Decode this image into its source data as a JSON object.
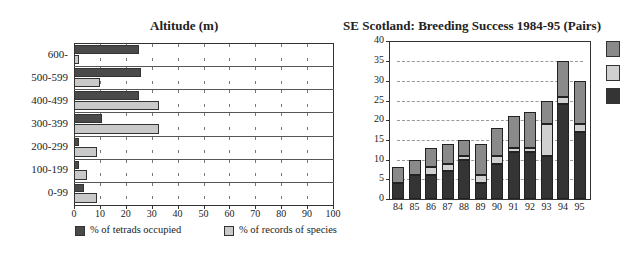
{
  "colors": {
    "left_tetrads": "#4a4a4a",
    "left_records": "#c9c9c9",
    "right_top": "#8a8a8a",
    "right_mid": "#d0d0d0",
    "right_bottom": "#343434"
  },
  "chart_data": [
    {
      "type": "bar",
      "orientation": "horizontal",
      "title": "Altitude (m)",
      "categories": [
        "600-",
        "500-599",
        "400-499",
        "300-399",
        "200-299",
        "100-199",
        "0-99"
      ],
      "series": [
        {
          "name": "% of tetrads occupied",
          "values": [
            25,
            26,
            25,
            11,
            2,
            2,
            4
          ]
        },
        {
          "name": "% of records of species",
          "values": [
            2,
            10,
            33,
            33,
            9,
            5,
            9
          ]
        }
      ],
      "xlabel": "",
      "ylabel": "",
      "xlim": [
        0,
        100
      ],
      "xticks": [
        "0",
        "10",
        "20",
        "30",
        "40",
        "50",
        "60",
        "70",
        "80",
        "90",
        "100"
      ],
      "grid": "dotted tick marks",
      "legend_position": "bottom"
    },
    {
      "type": "bar",
      "orientation": "vertical",
      "stacked": true,
      "title": "SE Scotland:  Breeding Success 1984-95 (Pairs)",
      "categories": [
        "84",
        "85",
        "86",
        "87",
        "88",
        "89",
        "90",
        "91",
        "92",
        "93",
        "94",
        "95"
      ],
      "series": [
        {
          "name": "bottom (dark)",
          "values": [
            4,
            6,
            6,
            7,
            10,
            4,
            9,
            12,
            12,
            11,
            24,
            17
          ]
        },
        {
          "name": "middle (light)",
          "values": [
            0,
            0,
            2,
            2,
            1,
            2,
            2,
            1,
            1,
            8,
            2,
            2
          ]
        },
        {
          "name": "top (mid gray)",
          "values": [
            4,
            4,
            5,
            5,
            4,
            8,
            7,
            8,
            9,
            6,
            9,
            11
          ]
        }
      ],
      "totals": [
        8,
        10,
        13,
        14,
        15,
        14,
        18,
        21,
        22,
        25,
        35,
        30
      ],
      "xlabel": "",
      "ylabel": "",
      "ylim": [
        0,
        40
      ],
      "yticks": [
        "0",
        "5",
        "10",
        "15",
        "20",
        "25",
        "30",
        "35",
        "40"
      ],
      "grid": "dashed horizontal at every 5",
      "legend_position": "right (labels cut off)"
    }
  ]
}
